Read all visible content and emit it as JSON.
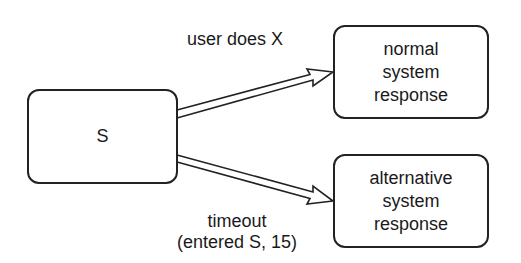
{
  "diagram": {
    "nodes": [
      {
        "id": "S",
        "label": "S"
      },
      {
        "id": "normal",
        "label_lines": [
          "normal",
          "system",
          "response"
        ]
      },
      {
        "id": "alternative",
        "label_lines": [
          "alternative",
          "system",
          "response"
        ]
      }
    ],
    "edges": [
      {
        "from": "S",
        "to": "normal",
        "label": "user does X"
      },
      {
        "from": "S",
        "to": "alternative",
        "label_lines": [
          "timeout",
          "(entered S, 15)"
        ]
      }
    ],
    "colors": {
      "stroke": "#222222",
      "background": "#ffffff"
    }
  }
}
